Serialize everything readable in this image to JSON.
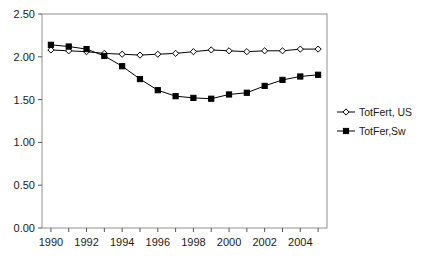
{
  "chart_data": {
    "type": "line",
    "title": "",
    "xlabel": "",
    "ylabel": "",
    "x": [
      1990,
      1991,
      1992,
      1993,
      1994,
      1995,
      1996,
      1997,
      1998,
      1999,
      2000,
      2001,
      2002,
      2003,
      2004,
      2005
    ],
    "xtick_labels": [
      "1990",
      "1992",
      "1994",
      "1996",
      "1998",
      "2000",
      "2002",
      "2004"
    ],
    "xticks": [
      1990,
      1992,
      1994,
      1996,
      1998,
      2000,
      2002,
      2004
    ],
    "ytick_labels": [
      "0.00",
      "0.50",
      "1.00",
      "1.50",
      "2.00",
      "2.50"
    ],
    "yticks": [
      0.0,
      0.5,
      1.0,
      1.5,
      2.0,
      2.5
    ],
    "xlim": [
      1989.5,
      2005.5
    ],
    "ylim": [
      0.0,
      2.5
    ],
    "grid": false,
    "legend_position": "right",
    "series": [
      {
        "name": "TotFert, US",
        "marker": "open-diamond",
        "color": "#000000",
        "values": [
          2.08,
          2.07,
          2.06,
          2.04,
          2.03,
          2.02,
          2.03,
          2.04,
          2.06,
          2.08,
          2.07,
          2.06,
          2.07,
          2.07,
          2.09,
          2.09
        ]
      },
      {
        "name": "TotFer,Sw",
        "marker": "filled-square",
        "color": "#000000",
        "values": [
          2.14,
          2.12,
          2.09,
          2.01,
          1.89,
          1.74,
          1.61,
          1.54,
          1.52,
          1.51,
          1.56,
          1.58,
          1.66,
          1.73,
          1.77,
          1.79
        ]
      }
    ]
  },
  "legend": {
    "items": [
      {
        "label": "TotFert, US",
        "marker": "open-diamond"
      },
      {
        "label": "TotFer,Sw",
        "marker": "filled-square"
      }
    ]
  },
  "axes": {
    "frame_color": "#808080",
    "tick_color": "#555555",
    "line_color": "#000000"
  }
}
